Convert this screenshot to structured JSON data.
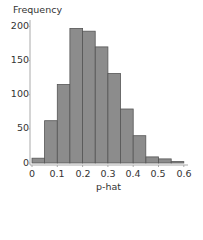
{
  "chart_data": {
    "type": "bar",
    "title": "",
    "xlabel": "p-hat",
    "ylabel": "Frequency",
    "bin_edges": [
      0,
      0.05,
      0.1,
      0.15,
      0.2,
      0.25,
      0.3,
      0.35,
      0.4,
      0.45,
      0.5,
      0.55,
      0.6
    ],
    "categories": [
      "0-0.05",
      "0.05-0.1",
      "0.1-0.15",
      "0.15-0.2",
      "0.2-0.25",
      "0.25-0.3",
      "0.3-0.35",
      "0.35-0.4",
      "0.4-0.45",
      "0.45-0.5",
      "0.5-0.55",
      "0.55-0.6"
    ],
    "values": [
      7,
      62,
      115,
      197,
      193,
      170,
      131,
      79,
      40,
      9,
      6,
      2
    ],
    "xlim": [
      0,
      0.6
    ],
    "ylim": [
      0,
      210
    ],
    "x_ticks": [
      "0",
      "0.1",
      "0.2",
      "0.3",
      "0.4",
      "0.5",
      "0.6"
    ],
    "y_ticks": [
      "0",
      "50",
      "100",
      "150",
      "200"
    ],
    "grid": false,
    "legend": null,
    "bar_color": "#8c8c8c",
    "bar_edge_color": "#555555"
  },
  "labels": {
    "y_title": "Frequency",
    "x_title": "p-hat",
    "y0": "0",
    "y50": "50",
    "y100": "100",
    "y150": "150",
    "y200": "200",
    "x0": "0",
    "x1": "0.1",
    "x2": "0.2",
    "x3": "0.3",
    "x4": "0.4",
    "x5": "0.5",
    "x6": "0.6"
  }
}
